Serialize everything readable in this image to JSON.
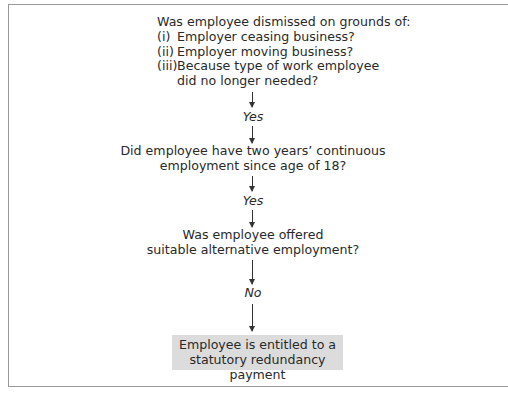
{
  "diagram": {
    "type": "flowchart",
    "colors": {
      "frame_border": "#9a9a9a",
      "text": "#2a2a2a",
      "arrow": "#333333",
      "result_box_fill": "#dcdcdc"
    },
    "question1": {
      "heading": "Was employee dismissed on grounds of:",
      "options": [
        {
          "num": "(i)",
          "text": "Employer ceasing business?"
        },
        {
          "num": "(ii)",
          "text": "Employer moving business?"
        },
        {
          "num": "(iii)",
          "text": "Because type of work employee"
        }
      ],
      "continuation": "did no longer needed?"
    },
    "answer1": "Yes",
    "question2": {
      "lines": [
        "Did employee have two years’ continuous",
        "employment since age of 18?"
      ]
    },
    "answer2": "Yes",
    "question3": {
      "lines": [
        "Was employee offered",
        "suitable alternative employment?"
      ]
    },
    "answer3": "No",
    "result": {
      "lines": [
        "Employee is entitled to a",
        "statutory redundancy payment"
      ]
    }
  }
}
